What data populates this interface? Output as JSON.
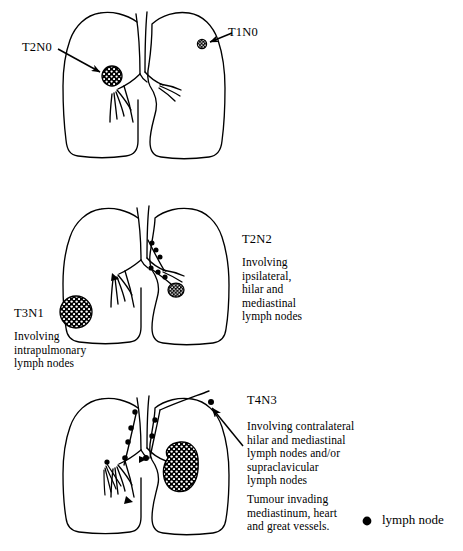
{
  "figure": {
    "panels": [
      {
        "id": "panel-1",
        "labels": [
          {
            "code": "T2N0",
            "description": ""
          },
          {
            "code": "T1N0",
            "description": ""
          }
        ]
      },
      {
        "id": "panel-2",
        "labels": [
          {
            "code": "T2N2",
            "description": "Involving\nipsilateral,\nhilar and\nmediastinal\nlymph nodes"
          },
          {
            "code": "T3N1",
            "description": "Involving\nintrapulmonary\nlymph nodes"
          }
        ]
      },
      {
        "id": "panel-3",
        "labels": [
          {
            "code": "T4N3",
            "description": "Involving contralateral\nhilar and mediastinal\nlymph nodes and/or\nsupraclavicular\nlymph nodes",
            "description2": "Tumour invading\nmediastinum, heart\nand great vessels."
          }
        ]
      }
    ]
  },
  "legend": {
    "label": "lymph node",
    "marker": "filled-circle"
  },
  "colors": {
    "ink": "#000000",
    "background": "#ffffff",
    "tumour_fill": "#000000",
    "tumour_stipple": "#ffffff"
  }
}
